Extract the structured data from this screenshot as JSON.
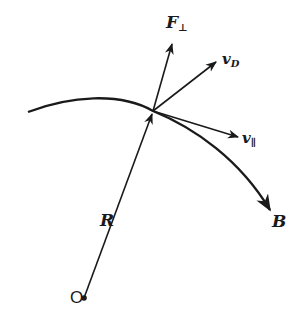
{
  "diagram": {
    "type": "vector-diagram",
    "stroke_color": "#1a1a1a",
    "background": "#ffffff",
    "point": {
      "x": 153,
      "y": 111
    },
    "origin": {
      "label": "O",
      "x": 84,
      "y": 298
    },
    "labels": {
      "F_perp": {
        "main": "F",
        "sub": "⊥"
      },
      "v_D": {
        "main": "v",
        "sub": "D"
      },
      "v_par": {
        "main": "v",
        "sub": "∥"
      },
      "B": {
        "main": "B"
      },
      "R": {
        "main": "R"
      },
      "O": {
        "main": "O"
      }
    },
    "vectors": [
      {
        "name": "R",
        "from": [
          84,
          298
        ],
        "to": [
          153,
          111
        ]
      },
      {
        "name": "F_perp",
        "from": [
          153,
          111
        ],
        "to": [
          172,
          43
        ]
      },
      {
        "name": "v_D",
        "from": [
          153,
          111
        ],
        "to": [
          215,
          62
        ]
      },
      {
        "name": "v_par",
        "from": [
          153,
          111
        ],
        "to": [
          237,
          137
        ]
      },
      {
        "name": "B",
        "description": "curved field line ending in arrow",
        "to": [
          272,
          212
        ]
      }
    ]
  }
}
